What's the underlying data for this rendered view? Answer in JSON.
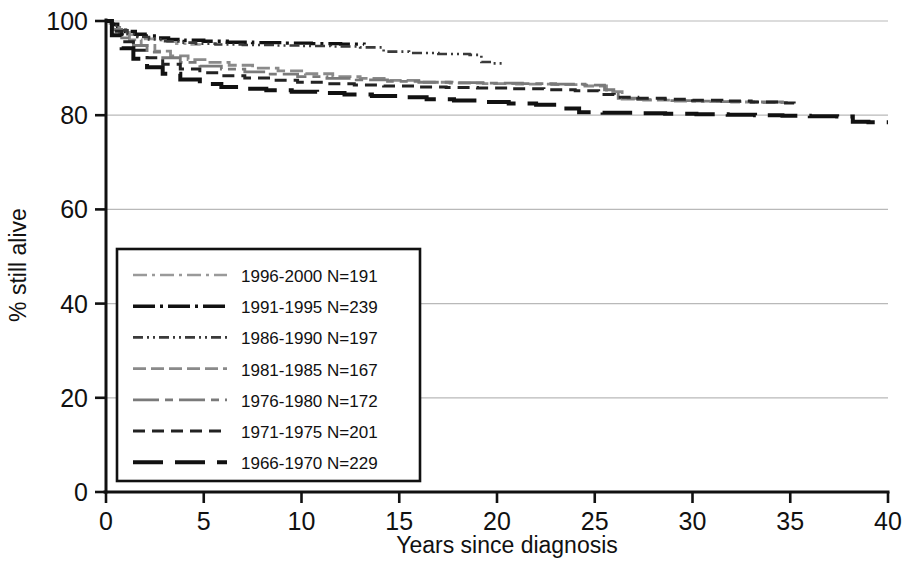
{
  "chart_data": {
    "type": "line",
    "title": "",
    "xlabel": "Years since diagnosis",
    "ylabel": "% still alive",
    "xlim": [
      0,
      40
    ],
    "ylim": [
      0,
      100
    ],
    "xticks": [
      0,
      5,
      10,
      15,
      20,
      25,
      30,
      35,
      40
    ],
    "yticks": [
      0,
      20,
      40,
      60,
      80,
      100
    ],
    "xtick_labels": [
      "0",
      "5",
      "10",
      "15",
      "20",
      "25",
      "30",
      "35",
      "40"
    ],
    "ytick_labels": [
      "0",
      "20",
      "40",
      "60",
      "80",
      "100"
    ],
    "grid": "horizontal",
    "grid_values": [
      20,
      40,
      60,
      80,
      100
    ],
    "legend_position": "lower-left-inside",
    "plot_style": "kaplan-meier step curves, monochrome, distinct dash patterns",
    "series": [
      {
        "name": "1996-2000 N=191",
        "cohort": "1996-2000",
        "n": 191,
        "color": "#9a9a9a",
        "dash": "14,5,3,5",
        "width": 2.6,
        "points": [
          [
            0,
            100
          ],
          [
            0.2,
            99.5
          ],
          [
            0.4,
            98.8
          ],
          [
            0.6,
            98.1
          ],
          [
            0.9,
            97.6
          ],
          [
            1.2,
            97.1
          ],
          [
            1.6,
            96.6
          ],
          [
            2.0,
            96.2
          ],
          [
            2.5,
            95.9
          ],
          [
            3.0,
            95.6
          ],
          [
            3.6,
            95.2
          ],
          [
            4.2,
            95.0
          ],
          [
            4.8,
            94.8
          ]
        ]
      },
      {
        "name": "1991-1995 N=239",
        "cohort": "1991-1995",
        "n": 239,
        "color": "#111111",
        "dash": "22,5,3,5",
        "width": 3.4,
        "points": [
          [
            0,
            100
          ],
          [
            0.3,
            99.3
          ],
          [
            0.6,
            98.5
          ],
          [
            1.0,
            97.8
          ],
          [
            1.5,
            97.2
          ],
          [
            2.0,
            96.8
          ],
          [
            2.6,
            96.4
          ],
          [
            3.2,
            96.1
          ],
          [
            4.0,
            95.9
          ],
          [
            5.0,
            95.7
          ],
          [
            6.2,
            95.5
          ],
          [
            7.5,
            95.4
          ],
          [
            9.0,
            95.3
          ],
          [
            10.5,
            95.2
          ],
          [
            12.0,
            95.1
          ],
          [
            13.2,
            95.0
          ]
        ]
      },
      {
        "name": "1986-1990 N=197",
        "cohort": "1986-1990",
        "n": 197,
        "color": "#3a3a3a",
        "dash": "10,4,2,4,2,4",
        "width": 2.6,
        "points": [
          [
            0,
            100
          ],
          [
            0.3,
            99.0
          ],
          [
            0.7,
            98.0
          ],
          [
            1.1,
            97.2
          ],
          [
            1.6,
            96.6
          ],
          [
            2.2,
            96.1
          ],
          [
            2.9,
            95.7
          ],
          [
            3.7,
            95.4
          ],
          [
            4.6,
            95.2
          ],
          [
            5.6,
            95.0
          ],
          [
            7.0,
            94.9
          ],
          [
            8.6,
            94.8
          ],
          [
            10.0,
            94.7
          ],
          [
            11.5,
            94.6
          ],
          [
            13.0,
            94.4
          ],
          [
            14.2,
            93.5
          ],
          [
            15.5,
            93.2
          ],
          [
            17.0,
            93.0
          ],
          [
            18.6,
            92.8
          ],
          [
            19.2,
            91.3
          ],
          [
            19.8,
            91.0
          ],
          [
            20.4,
            90.9
          ]
        ]
      },
      {
        "name": "1981-1985 N=167",
        "cohort": "1981-1985",
        "n": 167,
        "color": "#8a8a8a",
        "dash": "13,5",
        "width": 2.8,
        "points": [
          [
            0,
            100
          ],
          [
            0.3,
            98.6
          ],
          [
            0.7,
            97.2
          ],
          [
            1.2,
            96.0
          ],
          [
            1.8,
            94.8
          ],
          [
            2.5,
            93.6
          ],
          [
            3.3,
            92.6
          ],
          [
            4.2,
            91.8
          ],
          [
            5.2,
            91.2
          ],
          [
            6.3,
            90.6
          ],
          [
            7.5,
            90.0
          ],
          [
            8.8,
            89.4
          ],
          [
            10.2,
            88.8
          ],
          [
            11.6,
            88.2
          ],
          [
            13.0,
            87.8
          ],
          [
            14.5,
            87.4
          ],
          [
            16.0,
            87.0
          ],
          [
            17.6,
            86.8
          ],
          [
            19.3,
            86.7
          ],
          [
            21.0,
            86.6
          ],
          [
            22.8,
            86.5
          ],
          [
            24.5,
            86.2
          ],
          [
            25.6,
            85.0
          ],
          [
            26.4,
            83.4
          ],
          [
            27.5,
            83.2
          ],
          [
            29.0,
            83.0
          ],
          [
            30.5,
            82.9
          ],
          [
            32.0,
            82.8
          ],
          [
            33.5,
            82.7
          ],
          [
            34.8,
            82.6
          ]
        ]
      },
      {
        "name": "1976-1980 N=172",
        "cohort": "1976-1980",
        "n": 172,
        "color": "#7a7a7a",
        "dash": "26,6,8,6",
        "width": 2.8,
        "points": [
          [
            0,
            100
          ],
          [
            0.3,
            98.2
          ],
          [
            0.8,
            96.4
          ],
          [
            1.4,
            94.8
          ],
          [
            2.1,
            93.4
          ],
          [
            2.9,
            92.2
          ],
          [
            3.8,
            91.2
          ],
          [
            4.8,
            90.4
          ],
          [
            5.9,
            89.8
          ],
          [
            7.1,
            89.2
          ],
          [
            8.4,
            88.7
          ],
          [
            9.8,
            88.2
          ],
          [
            11.3,
            87.8
          ],
          [
            12.8,
            87.5
          ],
          [
            14.4,
            87.2
          ],
          [
            16.0,
            87.0
          ],
          [
            17.7,
            86.9
          ],
          [
            19.5,
            86.8
          ],
          [
            21.3,
            86.7
          ],
          [
            23.0,
            86.6
          ],
          [
            24.5,
            86.4
          ],
          [
            25.5,
            85.4
          ],
          [
            26.2,
            83.6
          ],
          [
            27.2,
            83.3
          ],
          [
            28.6,
            83.1
          ],
          [
            30.0,
            83.0
          ],
          [
            31.5,
            82.9
          ],
          [
            33.0,
            82.8
          ],
          [
            34.6,
            82.7
          ]
        ]
      },
      {
        "name": "1971-1975 N=201",
        "cohort": "1971-1975",
        "n": 201,
        "color": "#222222",
        "dash": "12,7",
        "width": 3.0,
        "points": [
          [
            0,
            100
          ],
          [
            0.3,
            97.8
          ],
          [
            0.8,
            95.6
          ],
          [
            1.4,
            93.8
          ],
          [
            2.1,
            92.2
          ],
          [
            2.9,
            90.8
          ],
          [
            3.8,
            89.8
          ],
          [
            4.8,
            89.0
          ],
          [
            5.9,
            88.4
          ],
          [
            7.1,
            87.9
          ],
          [
            8.4,
            87.4
          ],
          [
            9.8,
            87.0
          ],
          [
            11.2,
            86.7
          ],
          [
            12.7,
            86.4
          ],
          [
            14.2,
            86.2
          ],
          [
            15.8,
            86.0
          ],
          [
            17.4,
            85.9
          ],
          [
            19.0,
            85.8
          ],
          [
            20.7,
            85.6
          ],
          [
            22.4,
            85.4
          ],
          [
            24.0,
            85.2
          ],
          [
            25.2,
            84.4
          ],
          [
            26.0,
            83.8
          ],
          [
            27.2,
            83.6
          ],
          [
            28.6,
            83.4
          ],
          [
            30.0,
            83.2
          ],
          [
            31.5,
            83.0
          ],
          [
            33.0,
            82.8
          ],
          [
            34.4,
            82.6
          ],
          [
            35.2,
            82.5
          ]
        ]
      },
      {
        "name": "1966-1970 N=229",
        "cohort": "1966-1970",
        "n": 229,
        "color": "#111111",
        "dash": "30,12",
        "width": 4.0,
        "points": [
          [
            0,
            100
          ],
          [
            0.3,
            97.0
          ],
          [
            0.8,
            94.2
          ],
          [
            1.4,
            92.0
          ],
          [
            2.1,
            90.2
          ],
          [
            2.9,
            88.8
          ],
          [
            3.8,
            87.6
          ],
          [
            4.8,
            86.6
          ],
          [
            5.9,
            86.0
          ],
          [
            7.0,
            85.6
          ],
          [
            8.2,
            85.3
          ],
          [
            9.5,
            85.0
          ],
          [
            10.8,
            84.7
          ],
          [
            12.2,
            84.4
          ],
          [
            13.6,
            84.1
          ],
          [
            15.0,
            83.8
          ],
          [
            16.4,
            83.4
          ],
          [
            17.8,
            83.1
          ],
          [
            19.2,
            82.8
          ],
          [
            20.6,
            82.5
          ],
          [
            22.0,
            82.2
          ],
          [
            23.2,
            81.4
          ],
          [
            24.2,
            80.6
          ],
          [
            25.4,
            80.5
          ],
          [
            27.0,
            80.4
          ],
          [
            28.6,
            80.3
          ],
          [
            30.2,
            80.2
          ],
          [
            31.8,
            80.1
          ],
          [
            33.2,
            80.0
          ],
          [
            34.6,
            79.9
          ],
          [
            36.0,
            79.8
          ],
          [
            37.4,
            79.7
          ],
          [
            38.2,
            78.6
          ],
          [
            39.0,
            78.5
          ],
          [
            40.0,
            78.5
          ]
        ]
      }
    ]
  },
  "axes": {
    "y_axis_title": "% still alive",
    "x_axis_title": "Years since diagnosis"
  },
  "legend": {
    "entries": [
      {
        "label": "1996-2000 N=191"
      },
      {
        "label": "1991-1995 N=239"
      },
      {
        "label": "1986-1990 N=197"
      },
      {
        "label": "1981-1985 N=167"
      },
      {
        "label": "1976-1980 N=172"
      },
      {
        "label": "1971-1975 N=201"
      },
      {
        "label": "1966-1970 N=229"
      }
    ]
  }
}
